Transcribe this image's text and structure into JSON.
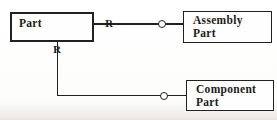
{
  "diagram": {
    "entities": {
      "part": {
        "label": "Part"
      },
      "assembly": {
        "line1": "Assembly",
        "line2": "Part"
      },
      "component": {
        "line1": "Component",
        "line2": "Part"
      }
    },
    "relationships": {
      "part_assembly": {
        "label": "R",
        "terminator": "circle"
      },
      "part_component": {
        "label": "R",
        "terminator": "circle"
      }
    },
    "colors": {
      "ink": "#23211f",
      "background": "#ffffff"
    }
  }
}
